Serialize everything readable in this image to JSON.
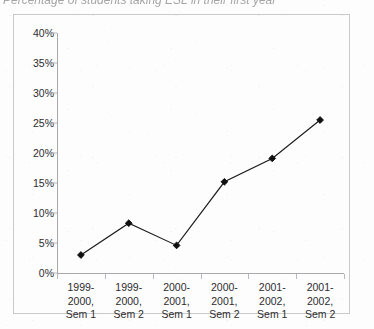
{
  "title_sliver": "Percentage of students taking ESL in their first year",
  "chart_data": {
    "type": "line",
    "title": "",
    "xlabel": "",
    "ylabel": "",
    "categories": [
      "1999-2000, Sem 1",
      "1999-2000, Sem 2",
      "2000-2001, Sem 1",
      "2000-2001, Sem 2",
      "2001-2002, Sem 1",
      "2001-2002, Sem 2"
    ],
    "category_lines": [
      [
        "1999-",
        "2000,",
        "Sem 1"
      ],
      [
        "1999-",
        "2000,",
        "Sem 2"
      ],
      [
        "2000-",
        "2001,",
        "Sem 1"
      ],
      [
        "2000-",
        "2001,",
        "Sem 2"
      ],
      [
        "2001-",
        "2002,",
        "Sem 1"
      ],
      [
        "2001-",
        "2002,",
        "Sem 2"
      ]
    ],
    "values": [
      3.0,
      8.3,
      4.6,
      15.2,
      19.1,
      25.5
    ],
    "value_labels": [
      "3%",
      "8.3%",
      "4.6%",
      "15.2%",
      "19.1%",
      "25.5%"
    ],
    "ylim": [
      0,
      40
    ],
    "ytick_values": [
      0,
      5,
      10,
      15,
      20,
      25,
      30,
      35,
      40
    ],
    "ytick_labels": [
      "0%",
      "5%",
      "10%",
      "15%",
      "20%",
      "25%",
      "30%",
      "35%",
      "40%"
    ],
    "grid": false,
    "legend": null,
    "marker": "diamond",
    "line_color": "#1a1a1a",
    "marker_color": "#101010",
    "axis_color": "#a9a9ad",
    "frame_color": "#c9c9cc",
    "text_color": "#2c2c2e"
  }
}
